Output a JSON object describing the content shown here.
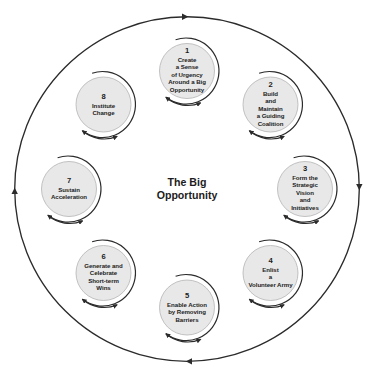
{
  "diagram": {
    "title": "The Big Opportunity",
    "center_label": "The Big\nOpportunity",
    "colors": {
      "node_fill": "#e8e8e8",
      "node_stroke": "#9a9a9a",
      "line": "#2b2b2b",
      "text": "#1c1c1c",
      "background": "#ffffff"
    },
    "outer_ring": {
      "direction": "clockwise",
      "arrow_positions": [
        "top",
        "right",
        "bottom",
        "left"
      ],
      "arrow_glyph_names": [
        "arrowhead-right-icon",
        "arrowhead-down-icon",
        "arrowhead-left-icon",
        "arrowhead-up-icon"
      ]
    },
    "steps": [
      {
        "number": "1",
        "text": "Create\na Sense\nof Urgency\nAround a Big\nOpportunity",
        "angle_deg": -90,
        "loop_icon": "clockwise-loop-arrow-icon"
      },
      {
        "number": "2",
        "text": "Build\nand\nMaintain\na Guiding\nCoalition",
        "angle_deg": -45,
        "loop_icon": "clockwise-loop-arrow-icon"
      },
      {
        "number": "3",
        "text": "Form the\nStrategic\nVision\nand\nInitiatives",
        "angle_deg": 0,
        "loop_icon": "clockwise-loop-arrow-icon"
      },
      {
        "number": "4",
        "text": "Enlist\na\nVolunteer Army",
        "angle_deg": 45,
        "loop_icon": "clockwise-loop-arrow-icon"
      },
      {
        "number": "5",
        "text": "Enable Action\nby Removing\nBarriers",
        "angle_deg": 90,
        "loop_icon": "clockwise-loop-arrow-icon"
      },
      {
        "number": "6",
        "text": "Generate and\nCelebrate\nShort-term\nWins",
        "angle_deg": 135,
        "loop_icon": "clockwise-loop-arrow-icon"
      },
      {
        "number": "7",
        "text": "Sustain\nAcceleration",
        "angle_deg": 180,
        "loop_icon": "clockwise-loop-arrow-icon"
      },
      {
        "number": "8",
        "text": "Institute\nChange",
        "angle_deg": 225,
        "loop_icon": "clockwise-loop-arrow-icon"
      }
    ]
  }
}
